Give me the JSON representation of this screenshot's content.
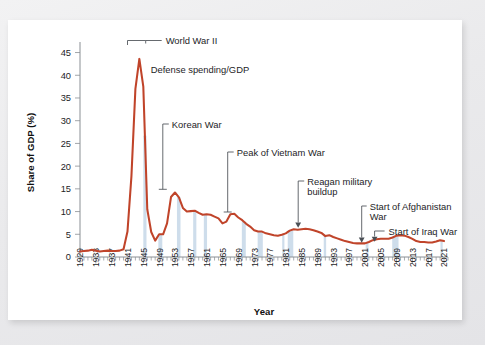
{
  "figure": {
    "background_color": "#ffffff",
    "page_background_color": "#ebebeb"
  },
  "chart_data": {
    "type": "line",
    "title": "",
    "xlabel": "Year",
    "ylabel": "Share of GDP (%)",
    "xlim": [
      1929,
      2022
    ],
    "ylim": [
      0,
      46
    ],
    "yticks": [
      0,
      5,
      10,
      15,
      20,
      25,
      30,
      35,
      40,
      45
    ],
    "xticks": [
      1929,
      1933,
      1937,
      1941,
      1945,
      1949,
      1953,
      1957,
      1961,
      1965,
      1969,
      1973,
      1977,
      1981,
      1985,
      1989,
      1993,
      1997,
      2001,
      2005,
      2009,
      2013,
      2017,
      2021
    ],
    "grid": false,
    "legend": "none",
    "series": [
      {
        "name": "Defense spending/GDP",
        "color": "#c0442a",
        "x": [
          1929,
          1930,
          1931,
          1932,
          1933,
          1934,
          1935,
          1936,
          1937,
          1938,
          1939,
          1940,
          1941,
          1942,
          1943,
          1944,
          1945,
          1946,
          1947,
          1948,
          1949,
          1950,
          1951,
          1952,
          1953,
          1954,
          1955,
          1956,
          1957,
          1958,
          1959,
          1960,
          1961,
          1962,
          1963,
          1964,
          1965,
          1966,
          1967,
          1968,
          1969,
          1970,
          1971,
          1972,
          1973,
          1974,
          1975,
          1976,
          1977,
          1978,
          1979,
          1980,
          1981,
          1982,
          1983,
          1984,
          1985,
          1986,
          1987,
          1988,
          1989,
          1990,
          1991,
          1992,
          1993,
          1994,
          1995,
          1996,
          1997,
          1998,
          1999,
          2000,
          2001,
          2002,
          2003,
          2004,
          2005,
          2006,
          2007,
          2008,
          2009,
          2010,
          2011,
          2012,
          2013,
          2014,
          2015,
          2016,
          2017,
          2018,
          2019,
          2020,
          2021
        ],
        "values": [
          1.2,
          1.3,
          1.4,
          1.6,
          1.4,
          1.2,
          1.3,
          1.4,
          1.3,
          1.3,
          1.4,
          1.7,
          5.6,
          17.8,
          37.0,
          43.6,
          37.5,
          10.5,
          5.5,
          3.6,
          5.0,
          5.0,
          7.4,
          13.2,
          14.2,
          13.1,
          10.8,
          10.0,
          10.1,
          10.2,
          9.7,
          9.3,
          9.4,
          9.3,
          8.9,
          8.5,
          7.4,
          7.8,
          9.4,
          9.5,
          8.7,
          8.1,
          7.3,
          6.7,
          5.9,
          5.6,
          5.6,
          5.2,
          5.0,
          4.8,
          4.7,
          4.9,
          5.2,
          5.8,
          6.1,
          6.0,
          6.1,
          6.2,
          6.1,
          5.9,
          5.6,
          5.3,
          4.6,
          4.8,
          4.4,
          4.1,
          3.8,
          3.5,
          3.3,
          3.1,
          3.0,
          3.0,
          3.0,
          3.3,
          3.7,
          3.9,
          4.0,
          4.0,
          4.0,
          4.3,
          4.7,
          4.8,
          4.7,
          4.4,
          4.0,
          3.5,
          3.3,
          3.3,
          3.2,
          3.2,
          3.4,
          3.7,
          3.5
        ]
      }
    ],
    "recession_bands": [
      {
        "start": 1945.0,
        "end": 1945.8
      },
      {
        "start": 1948.8,
        "end": 1949.8
      },
      {
        "start": 1953.5,
        "end": 1954.4
      },
      {
        "start": 1957.6,
        "end": 1958.4
      },
      {
        "start": 1960.3,
        "end": 1961.1
      },
      {
        "start": 1969.9,
        "end": 1970.9
      },
      {
        "start": 1973.9,
        "end": 1975.2
      },
      {
        "start": 1980.1,
        "end": 1980.6
      },
      {
        "start": 1981.5,
        "end": 1982.9
      },
      {
        "start": 1990.6,
        "end": 1991.2
      },
      {
        "start": 2001.2,
        "end": 2001.9
      },
      {
        "start": 2007.9,
        "end": 2009.5
      },
      {
        "start": 2020.1,
        "end": 2020.4
      }
    ],
    "annotations": [
      {
        "id": "world-war-2",
        "label": "World War II",
        "marker": "bracket"
      },
      {
        "id": "defense-spending-gdp",
        "label": "Defense spending/GDP",
        "marker": "none"
      },
      {
        "id": "korean-war",
        "label": "Korean War",
        "marker": "elbow-tick"
      },
      {
        "id": "peak-of-vietnam-war",
        "label": "Peak of Vietnam War",
        "marker": "elbow-tick"
      },
      {
        "id": "reagan-military-buildup",
        "label": "Reagan military",
        "label2": "buildup",
        "marker": "elbow-arrow"
      },
      {
        "id": "start-of-afghanistan-war",
        "label": "Start of Afghanistan",
        "label2": "War",
        "marker": "elbow-arrow"
      },
      {
        "id": "start-of-iraq-war",
        "label": "Start of Iraq War",
        "marker": "elbow-arrow"
      }
    ],
    "colors": {
      "line": "#c0442a",
      "band": "#c6d7e8",
      "axis": "#8a8f94",
      "text": "#1d1d1f",
      "leader": "#4a4f55"
    }
  }
}
